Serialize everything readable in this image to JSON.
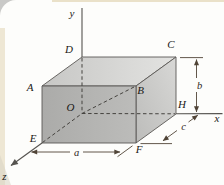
{
  "figure": {
    "vertex_labels": {
      "A": "A",
      "B": "B",
      "C": "C",
      "D": "D",
      "E": "E",
      "F": "F",
      "H": "H",
      "O": "O"
    },
    "axis_labels": {
      "x": "x",
      "y": "y",
      "z": "z"
    },
    "dimension_labels": {
      "a": "a",
      "b": "b",
      "c": "c"
    },
    "colors": {
      "top_face_light": "#e3e3e1",
      "top_face_dark": "#c7c7c5",
      "front_face": "#b3b3b1",
      "right_face_light": "#d6d6d4",
      "right_face_dark": "#bfbfbd",
      "edge_line": "#55534f",
      "dashed_line": "#45433f",
      "dimension_line": "#504437",
      "label_text": "#1b1916",
      "card_background": "#fdfdfb",
      "page_edge_cream": "#ece4cf",
      "outer_gray": "#c9c9c7"
    }
  }
}
